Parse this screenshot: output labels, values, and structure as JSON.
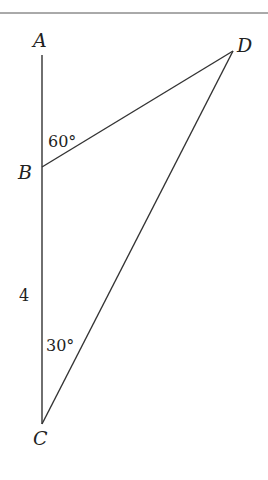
{
  "diagram": {
    "points": {
      "A": {
        "label": "A"
      },
      "B": {
        "label": "B"
      },
      "C": {
        "label": "C"
      },
      "D": {
        "label": "D"
      }
    },
    "angles": {
      "ABD": "60°",
      "BCD": "30°"
    },
    "lengths": {
      "BC": "4"
    }
  }
}
